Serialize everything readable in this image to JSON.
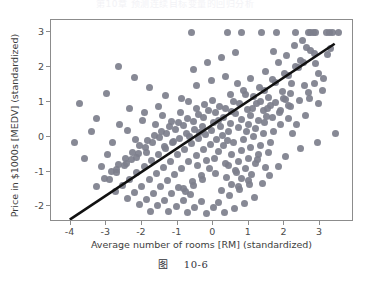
{
  "header": {
    "text": "第10章 预测连续目标变量的回归分析"
  },
  "caption": {
    "label": "图",
    "number": "10-6"
  },
  "chart_data": {
    "type": "scatter",
    "title": "",
    "xlabel": "Average number of rooms [RM] (standardized)",
    "ylabel": "Price in $1000s [MEDV] (standardized)",
    "xlim": [
      -4.55,
      3.95
    ],
    "ylim": [
      -2.45,
      3.35
    ],
    "xticks": [
      -4,
      -3,
      -2,
      -1,
      0,
      1,
      2,
      3
    ],
    "xticklabels": [
      "-4",
      "-3",
      "-2",
      "-1",
      "0",
      "1",
      "2",
      "3"
    ],
    "yticks": [
      -2,
      -1,
      0,
      1,
      2,
      3
    ],
    "yticklabels": [
      "-2",
      "-1",
      "0",
      "1",
      "2",
      "3"
    ],
    "grid": false,
    "legend": null,
    "marker_color": "#7d7f8c",
    "marker_size": 7,
    "series": [
      {
        "name": "RM vs MEDV (standardized)",
        "type": "scatter",
        "points": [
          [
            -0.62,
            2.99
          ],
          [
            0.4,
            2.99
          ],
          [
            0.78,
            2.99
          ],
          [
            1.36,
            2.99
          ],
          [
            1.78,
            2.99
          ],
          [
            2.3,
            2.99
          ],
          [
            2.66,
            2.99
          ],
          [
            2.74,
            2.99
          ],
          [
            2.8,
            2.99
          ],
          [
            2.86,
            2.99
          ],
          [
            3.18,
            2.99
          ],
          [
            3.26,
            2.99
          ],
          [
            3.34,
            2.99
          ],
          [
            3.52,
            2.99
          ],
          [
            2.62,
            2.55
          ],
          [
            2.72,
            2.48
          ],
          [
            2.84,
            2.4
          ],
          [
            3.22,
            2.36
          ],
          [
            3.3,
            2.52
          ],
          [
            2.46,
            2.18
          ],
          [
            2.54,
            2.12
          ],
          [
            2.88,
            2.1
          ],
          [
            2.3,
            2.02
          ],
          [
            2.38,
            1.98
          ],
          [
            2.0,
            1.82
          ],
          [
            2.1,
            1.76
          ],
          [
            2.96,
            1.8
          ],
          [
            3.1,
            1.66
          ],
          [
            1.66,
            1.64
          ],
          [
            1.74,
            1.56
          ],
          [
            2.2,
            1.52
          ],
          [
            2.56,
            1.48
          ],
          [
            1.3,
            1.42
          ],
          [
            1.44,
            1.34
          ],
          [
            1.94,
            1.3
          ],
          [
            2.66,
            1.26
          ],
          [
            0.92,
            1.22
          ],
          [
            1.12,
            1.16
          ],
          [
            1.56,
            1.12
          ],
          [
            2.04,
            1.08
          ],
          [
            2.42,
            1.04
          ],
          [
            0.56,
            1.02
          ],
          [
            0.74,
            0.96
          ],
          [
            1.22,
            0.94
          ],
          [
            1.62,
            0.9
          ],
          [
            2.16,
            0.86
          ],
          [
            0.18,
            0.88
          ],
          [
            0.34,
            0.8
          ],
          [
            0.96,
            0.78
          ],
          [
            1.4,
            0.74
          ],
          [
            1.86,
            0.7
          ],
          [
            -0.12,
            0.76
          ],
          [
            0.06,
            0.68
          ],
          [
            0.62,
            0.66
          ],
          [
            1.04,
            0.62
          ],
          [
            1.5,
            0.58
          ],
          [
            -0.42,
            0.64
          ],
          [
            -0.26,
            0.56
          ],
          [
            0.28,
            0.54
          ],
          [
            0.8,
            0.5
          ],
          [
            1.26,
            0.46
          ],
          [
            -0.72,
            0.52
          ],
          [
            -0.56,
            0.44
          ],
          [
            0.0,
            0.42
          ],
          [
            0.48,
            0.38
          ],
          [
            1.0,
            0.36
          ],
          [
            -0.98,
            0.4
          ],
          [
            -0.84,
            0.32
          ],
          [
            -0.3,
            0.3
          ],
          [
            0.2,
            0.28
          ],
          [
            0.7,
            0.26
          ],
          [
            -1.22,
            0.28
          ],
          [
            -1.06,
            0.22
          ],
          [
            -0.52,
            0.2
          ],
          [
            -0.04,
            0.18
          ],
          [
            0.44,
            0.16
          ],
          [
            -1.46,
            0.16
          ],
          [
            -1.3,
            0.1
          ],
          [
            -0.76,
            0.08
          ],
          [
            -0.22,
            0.06
          ],
          [
            0.26,
            0.04
          ],
          [
            -1.64,
            0.04
          ],
          [
            -1.5,
            -0.02
          ],
          [
            -0.94,
            -0.04
          ],
          [
            -0.4,
            -0.06
          ],
          [
            0.1,
            -0.08
          ],
          [
            -1.84,
            -0.1
          ],
          [
            -1.7,
            -0.16
          ],
          [
            -1.14,
            -0.18
          ],
          [
            -0.6,
            -0.2
          ],
          [
            -0.08,
            -0.22
          ],
          [
            -2.06,
            -0.26
          ],
          [
            -1.9,
            -0.32
          ],
          [
            -1.34,
            -0.34
          ],
          [
            -0.8,
            -0.36
          ],
          [
            -0.28,
            -0.38
          ],
          [
            -2.26,
            -0.44
          ],
          [
            -2.1,
            -0.48
          ],
          [
            -1.54,
            -0.5
          ],
          [
            -1.0,
            -0.52
          ],
          [
            -0.48,
            -0.54
          ],
          [
            -2.46,
            -0.62
          ],
          [
            -2.3,
            -0.66
          ],
          [
            -1.74,
            -0.68
          ],
          [
            -1.2,
            -0.7
          ],
          [
            -0.68,
            -0.72
          ],
          [
            -2.66,
            -0.8
          ],
          [
            -2.5,
            -0.84
          ],
          [
            -1.94,
            -0.86
          ],
          [
            -1.4,
            -0.88
          ],
          [
            -0.88,
            -0.9
          ],
          [
            -2.86,
            -1.0
          ],
          [
            -2.7,
            -1.04
          ],
          [
            -2.14,
            -1.04
          ],
          [
            -1.6,
            -1.06
          ],
          [
            -1.08,
            -1.08
          ],
          [
            -3.06,
            -1.2
          ],
          [
            -2.9,
            -1.22
          ],
          [
            -2.34,
            -1.22
          ],
          [
            -1.8,
            -1.24
          ],
          [
            -1.28,
            -1.26
          ],
          [
            -3.28,
            -1.42
          ],
          [
            -2.54,
            -1.4
          ],
          [
            -2.0,
            -1.42
          ],
          [
            -1.48,
            -1.44
          ],
          [
            -0.96,
            -1.46
          ],
          [
            -2.74,
            -1.58
          ],
          [
            -2.2,
            -1.6
          ],
          [
            -1.68,
            -1.62
          ],
          [
            -1.16,
            -1.64
          ],
          [
            -0.64,
            -1.66
          ],
          [
            -2.4,
            -1.78
          ],
          [
            -1.88,
            -1.8
          ],
          [
            -1.36,
            -1.82
          ],
          [
            -0.84,
            -1.84
          ],
          [
            -0.32,
            -1.86
          ],
          [
            -2.08,
            -1.96
          ],
          [
            -1.56,
            -1.98
          ],
          [
            -1.04,
            -2.0
          ],
          [
            -0.52,
            -2.02
          ],
          [
            0.0,
            -2.04
          ],
          [
            -1.76,
            -2.14
          ],
          [
            -1.24,
            -2.16
          ],
          [
            -0.72,
            -2.18
          ],
          [
            -0.2,
            -2.2
          ],
          [
            0.32,
            -2.18
          ],
          [
            0.6,
            -2.06
          ],
          [
            0.88,
            -1.92
          ],
          [
            1.16,
            -1.74
          ],
          [
            0.14,
            -1.9
          ],
          [
            0.46,
            -1.7
          ],
          [
            0.74,
            -1.52
          ],
          [
            1.02,
            -1.38
          ],
          [
            0.24,
            -1.54
          ],
          [
            0.52,
            -1.36
          ],
          [
            0.8,
            -1.2
          ],
          [
            1.08,
            -1.08
          ],
          [
            0.36,
            -1.18
          ],
          [
            0.64,
            -1.02
          ],
          [
            0.92,
            -0.9
          ],
          [
            1.2,
            -0.78
          ],
          [
            0.42,
            -0.84
          ],
          [
            0.7,
            -0.72
          ],
          [
            0.98,
            -0.62
          ],
          [
            1.26,
            -0.52
          ],
          [
            1.54,
            -0.44
          ],
          [
            0.5,
            -0.5
          ],
          [
            0.78,
            -0.4
          ],
          [
            1.06,
            -0.32
          ],
          [
            1.34,
            -0.24
          ],
          [
            1.62,
            -0.16
          ],
          [
            0.58,
            -0.16
          ],
          [
            0.86,
            -0.08
          ],
          [
            1.14,
            0.0
          ],
          [
            1.42,
            0.08
          ],
          [
            1.7,
            0.14
          ],
          [
            -3.74,
            0.94
          ],
          [
            -3.28,
            0.52
          ],
          [
            -2.82,
            -0.16
          ],
          [
            -2.62,
            0.36
          ],
          [
            -3.9,
            -0.18
          ],
          [
            -2.96,
            -0.52
          ],
          [
            -2.4,
            0.18
          ],
          [
            -2.18,
            -0.08
          ],
          [
            -1.98,
            0.46
          ],
          [
            -1.62,
            0.34
          ],
          [
            -1.42,
            0.62
          ],
          [
            -1.18,
            0.44
          ],
          [
            3.42,
            0.1
          ],
          [
            2.92,
            -0.18
          ],
          [
            2.46,
            -0.34
          ],
          [
            2.02,
            -0.58
          ],
          [
            1.82,
            -0.86
          ],
          [
            1.58,
            -1.12
          ],
          [
            1.38,
            -1.34
          ],
          [
            1.9,
            0.34
          ],
          [
            2.12,
            0.52
          ],
          [
            2.34,
            0.34
          ],
          [
            2.58,
            0.62
          ],
          [
            2.22,
            0.08
          ],
          [
            -0.9,
            1.1
          ],
          [
            -1.34,
            1.18
          ],
          [
            -1.78,
            1.42
          ],
          [
            -2.22,
            1.7
          ],
          [
            -2.66,
            2.02
          ],
          [
            -0.46,
            1.46
          ],
          [
            -0.06,
            1.6
          ],
          [
            0.34,
            1.72
          ],
          [
            -1.54,
            0.86
          ],
          [
            -1.94,
            0.7
          ],
          [
            -2.34,
            0.82
          ],
          [
            -0.7,
            1.02
          ],
          [
            0.68,
            1.52
          ],
          [
            1.06,
            1.66
          ],
          [
            1.48,
            1.88
          ],
          [
            1.84,
            2.12
          ],
          [
            2.06,
            2.34
          ],
          [
            2.28,
            2.62
          ],
          [
            2.5,
            2.76
          ],
          [
            1.7,
            2.44
          ],
          [
            -0.16,
            2.12
          ],
          [
            0.24,
            2.26
          ],
          [
            0.62,
            2.42
          ],
          [
            -0.56,
            1.94
          ],
          [
            -2.98,
            1.24
          ],
          [
            -3.42,
            0.16
          ],
          [
            -3.6,
            -0.62
          ],
          [
            -3.12,
            -0.86
          ],
          [
            0.04,
            -0.62
          ],
          [
            0.16,
            -0.42
          ],
          [
            0.28,
            -0.26
          ],
          [
            0.4,
            -0.12
          ],
          [
            -0.1,
            -0.92
          ],
          [
            -0.34,
            -1.12
          ],
          [
            -0.58,
            -1.3
          ],
          [
            -0.82,
            -1.48
          ],
          [
            1.44,
            0.42
          ],
          [
            1.66,
            0.56
          ],
          [
            1.88,
            0.74
          ],
          [
            2.1,
            0.9
          ],
          [
            0.94,
            0.14
          ],
          [
            1.18,
            0.24
          ],
          [
            0.52,
            0.72
          ],
          [
            0.14,
            0.46
          ],
          [
            -0.38,
            0.12
          ],
          [
            -0.66,
            0.0
          ],
          [
            -1.1,
            -0.14
          ],
          [
            -1.38,
            -0.28
          ],
          [
            -1.86,
            -0.44
          ],
          [
            -2.16,
            -0.6
          ],
          [
            -2.44,
            -0.76
          ],
          [
            -2.72,
            -0.94
          ],
          [
            1.32,
            1.0
          ],
          [
            1.1,
            0.82
          ],
          [
            0.86,
            1.34
          ],
          [
            0.48,
            1.2
          ],
          [
            -0.02,
            1.04
          ],
          [
            -0.24,
            0.92
          ],
          [
            -0.48,
            0.8
          ],
          [
            -0.92,
            0.68
          ],
          [
            2.7,
            1.1
          ],
          [
            2.94,
            0.94
          ],
          [
            3.06,
            1.34
          ],
          [
            2.84,
            1.54
          ],
          [
            2.16,
            1.24
          ],
          [
            1.96,
            1.1
          ],
          [
            1.76,
            0.98
          ],
          [
            1.52,
            0.8
          ],
          [
            -0.18,
            -0.68
          ],
          [
            -0.44,
            -0.82
          ],
          [
            0.62,
            -0.96
          ],
          [
            0.34,
            -0.78
          ],
          [
            0.06,
            -1.06
          ],
          [
            -0.3,
            -1.22
          ],
          [
            -0.54,
            -1.4
          ],
          [
            -0.78,
            -1.58
          ],
          [
            1.24,
            -0.66
          ],
          [
            1.46,
            -0.88
          ],
          [
            1.0,
            -1.26
          ],
          [
            0.72,
            -1.44
          ]
        ]
      },
      {
        "name": "linear regression fit",
        "type": "line",
        "color": "#111111",
        "width": 2.6,
        "endpoints": [
          [
            -4.02,
            -2.44
          ],
          [
            3.46,
            2.66
          ]
        ]
      }
    ]
  }
}
